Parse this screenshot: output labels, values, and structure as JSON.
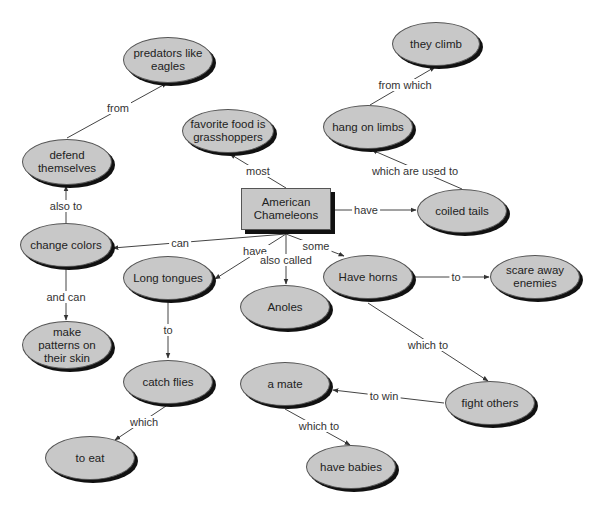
{
  "diagram": {
    "type": "concept-map",
    "root": "American Chameleons",
    "nodes": [
      {
        "id": "root",
        "label": "American\nChameleons",
        "shape": "rect",
        "x": 241,
        "y": 188,
        "w": 90,
        "h": 42
      },
      {
        "id": "predators",
        "label": "predators like\neagles",
        "shape": "ellipse",
        "cx": 168,
        "cy": 60,
        "w": 90,
        "h": 46
      },
      {
        "id": "climb",
        "label": "they climb",
        "shape": "ellipse",
        "cx": 436,
        "cy": 44,
        "w": 88,
        "h": 44
      },
      {
        "id": "food",
        "label": "favorite food is\ngrasshoppers",
        "shape": "ellipse",
        "cx": 228,
        "cy": 131,
        "w": 92,
        "h": 44
      },
      {
        "id": "limbs",
        "label": "hang on limbs",
        "shape": "ellipse",
        "cx": 368,
        "cy": 127,
        "w": 90,
        "h": 44
      },
      {
        "id": "defend",
        "label": "defend\nthemselves",
        "shape": "ellipse",
        "cx": 67,
        "cy": 162,
        "w": 90,
        "h": 46
      },
      {
        "id": "tails",
        "label": "coiled tails",
        "shape": "ellipse",
        "cx": 462,
        "cy": 211,
        "w": 90,
        "h": 44
      },
      {
        "id": "colors",
        "label": "change colors",
        "shape": "ellipse",
        "cx": 66,
        "cy": 245,
        "w": 92,
        "h": 44
      },
      {
        "id": "tongues",
        "label": "Long tongues",
        "shape": "ellipse",
        "cx": 168,
        "cy": 278,
        "w": 90,
        "h": 44
      },
      {
        "id": "anoles",
        "label": "Anoles",
        "shape": "ellipse",
        "cx": 285,
        "cy": 307,
        "w": 90,
        "h": 44
      },
      {
        "id": "horns",
        "label": "Have horns",
        "shape": "ellipse",
        "cx": 368,
        "cy": 277,
        "w": 90,
        "h": 44
      },
      {
        "id": "scare",
        "label": "scare away\nenemies",
        "shape": "ellipse",
        "cx": 535,
        "cy": 277,
        "w": 90,
        "h": 44
      },
      {
        "id": "patterns",
        "label": "make\npatterns on\ntheir skin",
        "shape": "ellipse",
        "cx": 67,
        "cy": 345,
        "w": 90,
        "h": 48
      },
      {
        "id": "flies",
        "label": "catch flies",
        "shape": "ellipse",
        "cx": 168,
        "cy": 382,
        "w": 90,
        "h": 44
      },
      {
        "id": "mate",
        "label": "a mate",
        "shape": "ellipse",
        "cx": 285,
        "cy": 384,
        "w": 90,
        "h": 44
      },
      {
        "id": "fight",
        "label": "fight others",
        "shape": "ellipse",
        "cx": 490,
        "cy": 403,
        "w": 90,
        "h": 44
      },
      {
        "id": "eat",
        "label": "to eat",
        "shape": "ellipse",
        "cx": 90,
        "cy": 458,
        "w": 90,
        "h": 44
      },
      {
        "id": "babies",
        "label": "have babies",
        "shape": "ellipse",
        "cx": 351,
        "cy": 467,
        "w": 90,
        "h": 44
      }
    ],
    "links": [
      {
        "from": "root",
        "to": "food",
        "label": "most",
        "path": [
          [
            286,
            188
          ],
          [
            230,
            154
          ]
        ],
        "lx": 258,
        "ly": 171
      },
      {
        "from": "root",
        "to": "tails",
        "label": "have",
        "path": [
          [
            335,
            210
          ],
          [
            416,
            210
          ]
        ],
        "lx": 366,
        "ly": 210
      },
      {
        "from": "tails",
        "to": "limbs",
        "label": "which are used to",
        "path": [
          [
            462,
            189
          ],
          [
            372,
            150
          ]
        ],
        "lx": 415,
        "ly": 171
      },
      {
        "from": "limbs",
        "to": "climb",
        "label": "from which",
        "path": [
          [
            370,
            105
          ],
          [
            435,
            67
          ]
        ],
        "lx": 405,
        "ly": 85
      },
      {
        "from": "root",
        "to": "colors",
        "label": "can",
        "path": [
          [
            286,
            234
          ],
          [
            113,
            248
          ]
        ],
        "lx": 180,
        "ly": 243
      },
      {
        "from": "root",
        "to": "tongues",
        "label": "have",
        "path": [
          [
            286,
            234
          ],
          [
            215,
            279
          ]
        ],
        "lx": 255,
        "ly": 251
      },
      {
        "from": "root",
        "to": "anoles",
        "label": "also called",
        "path": [
          [
            286,
            234
          ],
          [
            286,
            284
          ]
        ],
        "lx": 286,
        "ly": 260
      },
      {
        "from": "root",
        "to": "horns",
        "label": "some",
        "path": [
          [
            286,
            234
          ],
          [
            344,
            256
          ]
        ],
        "lx": 316,
        "ly": 246
      },
      {
        "from": "colors",
        "to": "defend",
        "label": "also to",
        "path": [
          [
            66,
            223
          ],
          [
            66,
            186
          ]
        ],
        "lx": 66,
        "ly": 206
      },
      {
        "from": "defend",
        "to": "predators",
        "label": "from",
        "path": [
          [
            67,
            138
          ],
          [
            167,
            83
          ]
        ],
        "lx": 118,
        "ly": 108
      },
      {
        "from": "colors",
        "to": "patterns",
        "label": "and can",
        "path": [
          [
            66,
            268
          ],
          [
            66,
            320
          ]
        ],
        "lx": 66,
        "ly": 297
      },
      {
        "from": "tongues",
        "to": "flies",
        "label": "to",
        "path": [
          [
            168,
            301
          ],
          [
            168,
            358
          ]
        ],
        "lx": 168,
        "ly": 330
      },
      {
        "from": "flies",
        "to": "eat",
        "label": "which",
        "path": [
          [
            166,
            406
          ],
          [
            115,
            440
          ]
        ],
        "lx": 144,
        "ly": 422
      },
      {
        "from": "horns",
        "to": "scare",
        "label": "to",
        "path": [
          [
            414,
            277
          ],
          [
            489,
            277
          ]
        ],
        "lx": 456,
        "ly": 277
      },
      {
        "from": "horns",
        "to": "fight",
        "label": "which to",
        "path": [
          [
            368,
            303
          ],
          [
            488,
            381
          ]
        ],
        "lx": 428,
        "ly": 345
      },
      {
        "from": "fight",
        "to": "mate",
        "label": "to win",
        "path": [
          [
            444,
            403
          ],
          [
            333,
            390
          ]
        ],
        "lx": 384,
        "ly": 396
      },
      {
        "from": "mate",
        "to": "babies",
        "label": "which to",
        "path": [
          [
            285,
            409
          ],
          [
            350,
            445
          ]
        ],
        "lx": 319,
        "ly": 426
      }
    ]
  },
  "colors": {
    "node_fill": "#c8c8c8",
    "node_border": "#555555",
    "node_shadow": "#111111",
    "line": "#444444",
    "background": "#ffffff"
  }
}
